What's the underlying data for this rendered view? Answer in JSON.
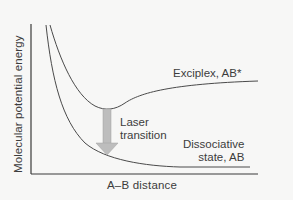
{
  "diagram": {
    "axes": {
      "y_label": "Molecular potential energy",
      "x_label": "A–B distance"
    },
    "curves": {
      "upper": {
        "label": "Exciplex, AB*",
        "color": "#4a4a4a"
      },
      "lower": {
        "label_line1": "Dissociative",
        "label_line2": "state, AB",
        "color": "#4a4a4a"
      }
    },
    "transition": {
      "label_line1": "Laser",
      "label_line2": "transition",
      "arrow_color": "#b9b9b9",
      "arrow_stroke": "#9a9a9a",
      "direction": "down"
    },
    "colors": {
      "background": "#f7f7f6",
      "axis": "#3a3a3a",
      "text": "#3c3c3c"
    }
  }
}
